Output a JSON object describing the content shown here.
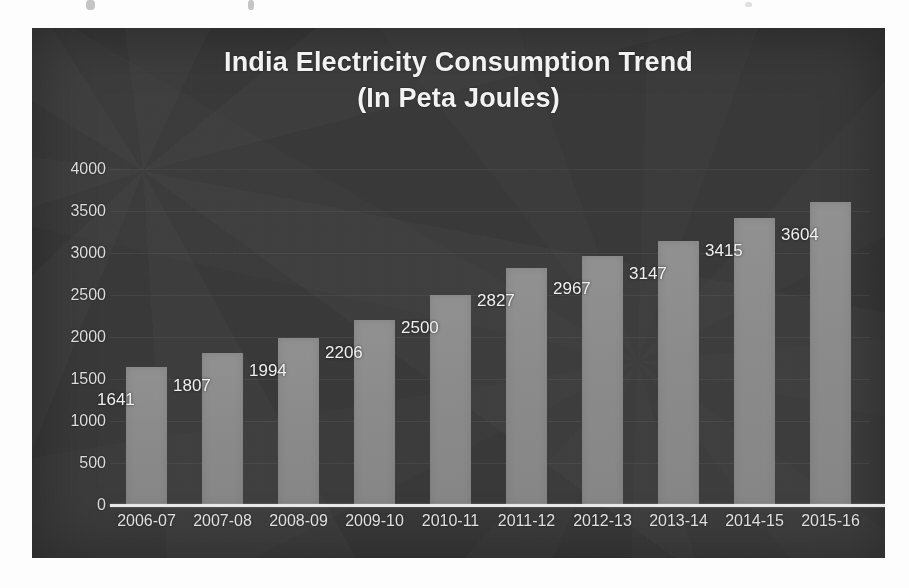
{
  "chart_data": {
    "type": "bar",
    "title": "India Electricity Consumption Trend",
    "subtitle": "(In Peta Joules)",
    "title_line1": "India Electricity Consumption Trend",
    "title_line2": "(In Peta Joules)",
    "xlabel": "",
    "ylabel": "",
    "ylim": [
      0,
      4000
    ],
    "ytick_values": [
      4000,
      3500,
      3000,
      2500,
      2000,
      1500,
      1000,
      500,
      0
    ],
    "ytick_labels": [
      "4000",
      "3500",
      "3000",
      "2500",
      "2000",
      "1500",
      "1000",
      "500",
      "0"
    ],
    "grid": true,
    "legend": false,
    "categories": [
      "2006-07",
      "2007-08",
      "2008-09",
      "2009-10",
      "2010-11",
      "2011-12",
      "2012-13",
      "2013-14",
      "2014-15",
      "2015-16"
    ],
    "values": [
      1641,
      1807,
      1994,
      2206,
      2500,
      2827,
      2967,
      3147,
      3415,
      3604
    ],
    "data_labels": [
      "1641",
      "1807",
      "1994",
      "2206",
      "2500",
      "2827",
      "2967",
      "3147",
      "3415",
      "3604"
    ],
    "series": [
      {
        "name": "Electricity Consumption",
        "values": [
          1641,
          1807,
          1994,
          2206,
          2500,
          2827,
          2967,
          3147,
          3415,
          3604
        ]
      }
    ]
  },
  "colors": {
    "panel_background": "#3b3b3b",
    "bar_fill": "#8b8b8b",
    "axis_line": "#e8e8e8",
    "title_text": "#f2f2f2",
    "tick_text": "#dcdcdc",
    "data_label_text": "#f0f0f0",
    "gridline": "#4a4a4a",
    "page_background": "#fdfdfd"
  }
}
